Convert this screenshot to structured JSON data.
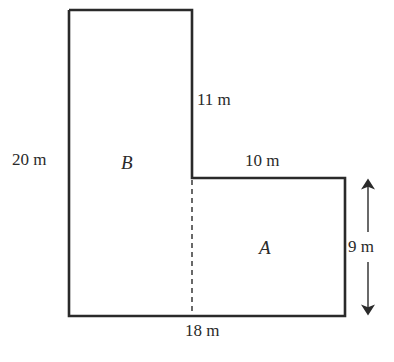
{
  "diagram": {
    "type": "composite-rectangle-floor-plan",
    "shape": "L-shaped",
    "regions": [
      {
        "name": "B",
        "label": "B"
      },
      {
        "name": "A",
        "label": "A"
      }
    ],
    "dimensions": {
      "left_height": "20 m",
      "upper_inner_right_side": "11 m",
      "step_width": "10 m",
      "right_height": "9 m",
      "bottom_width": "18 m"
    },
    "colors": {
      "line": "#2a2a2a",
      "background": "#ffffff"
    }
  }
}
